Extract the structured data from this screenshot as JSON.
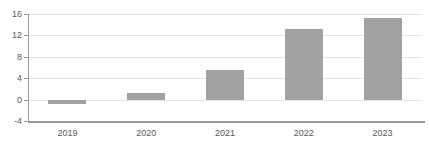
{
  "chart_data": {
    "type": "bar",
    "categories": [
      "2019",
      "2020",
      "2021",
      "2022",
      "2023"
    ],
    "values": [
      -0.8,
      1.2,
      5.5,
      13.2,
      15.3
    ],
    "title": "",
    "xlabel": "",
    "ylabel": "",
    "ylim": [
      -4,
      16
    ],
    "yticks": [
      16,
      12,
      8,
      4,
      0,
      -4
    ],
    "grid": true,
    "legend": false,
    "colors": {
      "bar": "#a2a2a2",
      "gridline": "#e4e4e4",
      "axis": "#9a9a9a",
      "tick_text": "#595959",
      "background": "#ffffff"
    }
  }
}
